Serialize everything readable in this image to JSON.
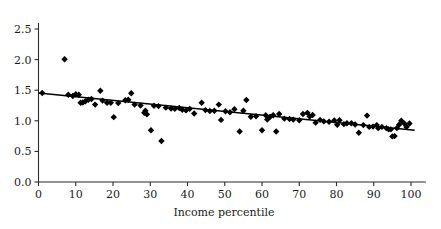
{
  "chart_data": {
    "type": "scatter",
    "title": "",
    "xlabel": "Income percentile",
    "ylabel": "",
    "xlim": [
      0,
      104
    ],
    "ylim": [
      0.0,
      2.6
    ],
    "grid": false,
    "legend": null,
    "xticks": [
      "0",
      "10",
      "20",
      "30",
      "40",
      "50",
      "60",
      "70",
      "80",
      "90",
      "100"
    ],
    "xtick_values": [
      0,
      10,
      20,
      30,
      40,
      50,
      60,
      70,
      80,
      90,
      100
    ],
    "yticks": [
      "0.0",
      "0.5",
      "1.0",
      "1.5",
      "2.0",
      "2.5"
    ],
    "ytick_values": [
      0.0,
      0.5,
      1.0,
      1.5,
      2.0,
      2.5
    ],
    "marker": "diamond",
    "marker_color": "#000000",
    "marker_size": 3.2,
    "points": [
      [
        1.0,
        1.455
      ],
      [
        7.0,
        2.005
      ],
      [
        8.0,
        1.425
      ],
      [
        9.2,
        1.405
      ],
      [
        10.0,
        1.435
      ],
      [
        10.8,
        1.425
      ],
      [
        11.3,
        1.295
      ],
      [
        11.9,
        1.3
      ],
      [
        12.6,
        1.32
      ],
      [
        13.4,
        1.345
      ],
      [
        14.2,
        1.355
      ],
      [
        15.2,
        1.265
      ],
      [
        16.6,
        1.49
      ],
      [
        17.2,
        1.33
      ],
      [
        18.4,
        1.295
      ],
      [
        19.4,
        1.295
      ],
      [
        20.2,
        1.06
      ],
      [
        21.4,
        1.29
      ],
      [
        23.3,
        1.335
      ],
      [
        24.1,
        1.345
      ],
      [
        24.9,
        1.45
      ],
      [
        25.8,
        1.265
      ],
      [
        27.4,
        1.25
      ],
      [
        28.4,
        1.13
      ],
      [
        28.7,
        1.165
      ],
      [
        29.1,
        1.105
      ],
      [
        30.2,
        0.845
      ],
      [
        31.0,
        1.245
      ],
      [
        32.2,
        1.24
      ],
      [
        33.0,
        0.67
      ],
      [
        34.2,
        1.215
      ],
      [
        35.6,
        1.2
      ],
      [
        36.6,
        1.195
      ],
      [
        37.8,
        1.21
      ],
      [
        38.6,
        1.18
      ],
      [
        39.6,
        1.17
      ],
      [
        40.6,
        1.195
      ],
      [
        41.8,
        1.12
      ],
      [
        43.8,
        1.295
      ],
      [
        44.8,
        1.175
      ],
      [
        46.0,
        1.16
      ],
      [
        47.2,
        1.165
      ],
      [
        48.4,
        1.265
      ],
      [
        49.0,
        1.015
      ],
      [
        50.2,
        1.155
      ],
      [
        51.4,
        1.14
      ],
      [
        52.6,
        1.19
      ],
      [
        54.0,
        0.825
      ],
      [
        55.0,
        1.165
      ],
      [
        55.8,
        1.34
      ],
      [
        57.0,
        1.065
      ],
      [
        58.4,
        1.075
      ],
      [
        60.0,
        0.845
      ],
      [
        61.0,
        1.09
      ],
      [
        61.4,
        1.02
      ],
      [
        62.2,
        1.065
      ],
      [
        63.0,
        1.09
      ],
      [
        63.8,
        0.825
      ],
      [
        64.6,
        1.11
      ],
      [
        66.0,
        1.035
      ],
      [
        67.4,
        1.03
      ],
      [
        68.4,
        1.02
      ],
      [
        70.0,
        1.01
      ],
      [
        71.0,
        1.11
      ],
      [
        72.2,
        1.13
      ],
      [
        72.8,
        1.07
      ],
      [
        73.6,
        1.095
      ],
      [
        74.4,
        0.97
      ],
      [
        75.6,
        1.015
      ],
      [
        76.6,
        0.99
      ],
      [
        78.0,
        0.985
      ],
      [
        79.4,
        1.005
      ],
      [
        80.2,
        0.935
      ],
      [
        80.8,
        1.01
      ],
      [
        82.0,
        0.945
      ],
      [
        82.8,
        0.96
      ],
      [
        84.0,
        0.96
      ],
      [
        85.0,
        0.94
      ],
      [
        86.0,
        0.805
      ],
      [
        87.2,
        0.93
      ],
      [
        88.2,
        1.085
      ],
      [
        88.8,
        0.9
      ],
      [
        89.8,
        0.905
      ],
      [
        90.8,
        0.93
      ],
      [
        91.2,
        0.88
      ],
      [
        92.2,
        0.9
      ],
      [
        93.4,
        0.88
      ],
      [
        94.0,
        0.86
      ],
      [
        94.6,
        0.86
      ],
      [
        95.0,
        0.745
      ],
      [
        95.6,
        0.75
      ],
      [
        96.2,
        0.88
      ],
      [
        96.8,
        0.935
      ],
      [
        97.4,
        1.0
      ],
      [
        98.2,
        0.955
      ],
      [
        98.8,
        0.9
      ],
      [
        99.6,
        0.955
      ]
    ],
    "trendline": {
      "type": "linear-fit",
      "x_start": 0,
      "y_start": 1.455,
      "x_end": 101,
      "y_end": 0.845,
      "color": "#000000"
    }
  }
}
